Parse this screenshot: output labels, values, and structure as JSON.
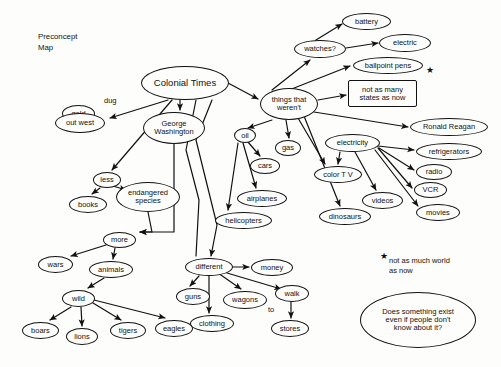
{
  "document": {
    "title_block": "Preconcept\nMap",
    "background_color": "#fdfdfc",
    "ink_color": "#111111",
    "width": 501,
    "height": 367
  },
  "nodes": [
    {
      "id": "colonial-times",
      "label": "Colonial Times",
      "shape": "ellipse",
      "x": 141,
      "y": 66,
      "w": 88,
      "h": 34,
      "font": 9.5
    },
    {
      "id": "gold",
      "label": "gold",
      "shape": "ellipse",
      "x": 62,
      "y": 105,
      "w": 33,
      "h": 17,
      "font": 7.5
    },
    {
      "id": "out-west",
      "label": "out west",
      "shape": "ellipse",
      "x": 55,
      "y": 113,
      "w": 50,
      "h": 20,
      "font": 7.5
    },
    {
      "id": "george-washington",
      "label": "George\nWashington",
      "shape": "ellipse",
      "x": 143,
      "y": 112,
      "w": 62,
      "h": 32,
      "font": 7.5
    },
    {
      "id": "things-that-werent",
      "label": "things that\nweren't",
      "shape": "ellipse",
      "x": 260,
      "y": 88,
      "w": 58,
      "h": 32,
      "font": 7.5
    },
    {
      "id": "battery",
      "label": "battery",
      "shape": "ellipse",
      "x": 342,
      "y": 13,
      "w": 49,
      "h": 17,
      "font": 7.5
    },
    {
      "id": "watches",
      "label": "watches?",
      "shape": "ellipse",
      "x": 294,
      "y": 40,
      "w": 52,
      "h": 18,
      "font": 7.5
    },
    {
      "id": "electric",
      "label": "electric",
      "shape": "ellipse",
      "x": 379,
      "y": 34,
      "w": 52,
      "h": 18,
      "font": 7.5
    },
    {
      "id": "ballpoint-pens",
      "label": "ballpoint pens",
      "shape": "ellipse",
      "x": 353,
      "y": 57,
      "w": 70,
      "h": 17,
      "font": 7.5
    },
    {
      "id": "not-as-many-states",
      "label": "not as many\nstates as now",
      "shape": "rect",
      "x": 348,
      "y": 80,
      "w": 69,
      "h": 27,
      "font": 7.5
    },
    {
      "id": "ronald-reagan",
      "label": "Ronald Reagan",
      "shape": "ellipse",
      "x": 410,
      "y": 118,
      "w": 78,
      "h": 18,
      "font": 7.5
    },
    {
      "id": "oil",
      "label": "oil",
      "shape": "ellipse",
      "x": 234,
      "y": 128,
      "w": 22,
      "h": 15,
      "font": 7.5
    },
    {
      "id": "gas",
      "label": "gas",
      "shape": "ellipse",
      "x": 275,
      "y": 140,
      "w": 26,
      "h": 16,
      "font": 7.5
    },
    {
      "id": "cars",
      "label": "cars",
      "shape": "ellipse",
      "x": 250,
      "y": 158,
      "w": 30,
      "h": 16,
      "font": 7.5
    },
    {
      "id": "airplanes",
      "label": "airplanes",
      "shape": "ellipse",
      "x": 237,
      "y": 190,
      "w": 50,
      "h": 17,
      "font": 7.5
    },
    {
      "id": "helicopters",
      "label": "helicopters",
      "shape": "ellipse",
      "x": 215,
      "y": 212,
      "w": 57,
      "h": 17,
      "font": 7.5
    },
    {
      "id": "electricity",
      "label": "electricity",
      "shape": "ellipse",
      "x": 325,
      "y": 134,
      "w": 55,
      "h": 18,
      "font": 7.5
    },
    {
      "id": "refrigerators",
      "label": "refrigerators",
      "shape": "ellipse",
      "x": 416,
      "y": 143,
      "w": 66,
      "h": 17,
      "font": 7.5
    },
    {
      "id": "radio",
      "label": "radio",
      "shape": "ellipse",
      "x": 416,
      "y": 164,
      "w": 36,
      "h": 16,
      "font": 7.5
    },
    {
      "id": "vcr",
      "label": "VCR",
      "shape": "ellipse",
      "x": 414,
      "y": 182,
      "w": 33,
      "h": 16,
      "font": 7.5
    },
    {
      "id": "movies",
      "label": "movies",
      "shape": "ellipse",
      "x": 416,
      "y": 204,
      "w": 44,
      "h": 17,
      "font": 7.5
    },
    {
      "id": "color-tv",
      "label": "color T V",
      "shape": "ellipse",
      "x": 314,
      "y": 166,
      "w": 48,
      "h": 17,
      "font": 7.5
    },
    {
      "id": "videos",
      "label": "videos",
      "shape": "ellipse",
      "x": 362,
      "y": 192,
      "w": 41,
      "h": 17,
      "font": 7.5
    },
    {
      "id": "dinosaurs",
      "label": "dinosaurs",
      "shape": "ellipse",
      "x": 319,
      "y": 208,
      "w": 52,
      "h": 17,
      "font": 7.5
    },
    {
      "id": "less",
      "label": "less",
      "shape": "ellipse",
      "x": 93,
      "y": 172,
      "w": 28,
      "h": 16,
      "font": 7.5
    },
    {
      "id": "books",
      "label": "books",
      "shape": "ellipse",
      "x": 69,
      "y": 196,
      "w": 38,
      "h": 17,
      "font": 7.5
    },
    {
      "id": "endangered-species",
      "label": "endangered\nspecies",
      "shape": "ellipse",
      "x": 116,
      "y": 182,
      "w": 64,
      "h": 30,
      "font": 7.5
    },
    {
      "id": "more",
      "label": "more",
      "shape": "ellipse",
      "x": 103,
      "y": 232,
      "w": 33,
      "h": 16,
      "font": 7.5
    },
    {
      "id": "wars",
      "label": "wars",
      "shape": "ellipse",
      "x": 38,
      "y": 256,
      "w": 35,
      "h": 17,
      "font": 7.5
    },
    {
      "id": "animals",
      "label": "animals",
      "shape": "ellipse",
      "x": 89,
      "y": 261,
      "w": 44,
      "h": 17,
      "font": 7.5
    },
    {
      "id": "wild",
      "label": "wild",
      "shape": "ellipse",
      "x": 62,
      "y": 290,
      "w": 33,
      "h": 17,
      "font": 7.5
    },
    {
      "id": "boars",
      "label": "boars",
      "shape": "ellipse",
      "x": 22,
      "y": 322,
      "w": 37,
      "h": 17,
      "font": 7.5
    },
    {
      "id": "lions",
      "label": "lions",
      "shape": "ellipse",
      "x": 66,
      "y": 328,
      "w": 32,
      "h": 17,
      "font": 7.5
    },
    {
      "id": "tigers",
      "label": "tigers",
      "shape": "ellipse",
      "x": 110,
      "y": 322,
      "w": 36,
      "h": 17,
      "font": 7.5
    },
    {
      "id": "eagles",
      "label": "eagles",
      "shape": "ellipse",
      "x": 155,
      "y": 320,
      "w": 38,
      "h": 17,
      "font": 7.5
    },
    {
      "id": "different",
      "label": "different",
      "shape": "ellipse",
      "x": 185,
      "y": 258,
      "w": 48,
      "h": 18,
      "font": 7.5
    },
    {
      "id": "money",
      "label": "money",
      "shape": "ellipse",
      "x": 251,
      "y": 259,
      "w": 42,
      "h": 17,
      "font": 7.5
    },
    {
      "id": "guns",
      "label": "guns",
      "shape": "ellipse",
      "x": 176,
      "y": 288,
      "w": 34,
      "h": 17,
      "font": 7.5
    },
    {
      "id": "wagons",
      "label": "wagons",
      "shape": "ellipse",
      "x": 223,
      "y": 291,
      "w": 44,
      "h": 18,
      "font": 7.5
    },
    {
      "id": "walk",
      "label": "walk",
      "shape": "ellipse",
      "x": 275,
      "y": 285,
      "w": 34,
      "h": 17,
      "font": 7.5
    },
    {
      "id": "clothing",
      "label": "clothing",
      "shape": "ellipse",
      "x": 190,
      "y": 315,
      "w": 44,
      "h": 17,
      "font": 7.5
    },
    {
      "id": "stores",
      "label": "stores",
      "shape": "ellipse",
      "x": 271,
      "y": 320,
      "w": 38,
      "h": 17,
      "font": 7.5
    },
    {
      "id": "does-something-exist",
      "label": "Does something exist\neven if people don't\nknow about it?",
      "shape": "ellipse",
      "x": 360,
      "y": 292,
      "w": 116,
      "h": 56,
      "font": 7.5
    }
  ],
  "edge_labels": [
    {
      "id": "dug-label",
      "text": "dug",
      "x": 104,
      "y": 96,
      "font": 7.5
    },
    {
      "id": "to-label",
      "text": "to",
      "x": 268,
      "y": 305,
      "font": 7.5
    }
  ],
  "free_texts": [
    {
      "id": "footnote",
      "text": "not as much world\nas now",
      "x": 389,
      "y": 256,
      "font": 7.5
    }
  ],
  "stars": [
    {
      "id": "star-top",
      "x": 426,
      "y": 66,
      "font": 9
    },
    {
      "id": "star-footnote",
      "x": 380,
      "y": 252,
      "font": 9
    }
  ],
  "edges": [
    {
      "from": "colonial-times",
      "to": "out-west",
      "path": "M 168 100 L 110 118",
      "arrow": true
    },
    {
      "from": "colonial-times",
      "to": "george-washington",
      "path": "M 180 100 L 180 110",
      "arrow": true
    },
    {
      "from": "colonial-times",
      "to": "less",
      "path": "M 172 100 L 112 170",
      "arrow": true
    },
    {
      "from": "colonial-times",
      "to": "things-that-werent",
      "path": "M 228 83 L 258 99",
      "arrow": true
    },
    {
      "from": "colonial-times",
      "to": "different",
      "path": "M 212 100 L 196 140 L 217 225 L 211 256",
      "arrow": true
    },
    {
      "from": "colonial-times",
      "to": "oil-branch",
      "path": "M 196 100 L 186 150 L 199 200 L 196 256",
      "arrow": false
    },
    {
      "from": "george-washington",
      "to": "more",
      "path": "M 174 144 L 174 232 L 140 232",
      "arrow": true
    },
    {
      "from": "less",
      "to": "books",
      "path": "M 100 188 L 92 194",
      "arrow": true
    },
    {
      "from": "less",
      "to": "endangered-species",
      "path": "M 113 186 L 126 190",
      "arrow": true
    },
    {
      "from": "endangered-species",
      "to": "more",
      "path": "M 148 212 L 152 232 L 140 232",
      "arrow": true
    },
    {
      "from": "more",
      "to": "wars",
      "path": "M 106 245 L 71 256",
      "arrow": true
    },
    {
      "from": "more",
      "to": "animals",
      "path": "M 115 248 L 113 259",
      "arrow": true
    },
    {
      "from": "animals",
      "to": "wild",
      "path": "M 104 278 L 88 288",
      "arrow": true
    },
    {
      "from": "wild",
      "to": "boars",
      "path": "M 71 307 L 50 320",
      "arrow": true
    },
    {
      "from": "wild",
      "to": "lions",
      "path": "M 81 307 L 82 326",
      "arrow": true
    },
    {
      "from": "wild",
      "to": "tigers",
      "path": "M 93 303 L 121 320",
      "arrow": true
    },
    {
      "from": "wild",
      "to": "eagles",
      "path": "M 94 300 L 165 318",
      "arrow": true
    },
    {
      "from": "different",
      "to": "guns",
      "path": "M 199 276 L 190 286",
      "arrow": true
    },
    {
      "from": "different",
      "to": "clothing",
      "path": "M 209 276 L 209 313",
      "arrow": true
    },
    {
      "from": "different",
      "to": "wagons",
      "path": "M 218 273 L 241 289",
      "arrow": true
    },
    {
      "from": "different",
      "to": "money",
      "path": "M 233 267 L 249 267",
      "arrow": true
    },
    {
      "from": "different",
      "to": "walk",
      "path": "M 227 273 L 281 289",
      "arrow": true
    },
    {
      "from": "walk",
      "to": "stores",
      "path": "M 291 302 L 291 318",
      "arrow": true
    },
    {
      "from": "things-that-werent",
      "to": "watches",
      "path": "M 272 90 L 310 60",
      "arrow": true
    },
    {
      "from": "watches",
      "to": "battery",
      "path": "M 316 40 L 342 24",
      "arrow": true
    },
    {
      "from": "watches",
      "to": "electric",
      "path": "M 346 48 L 378 43",
      "arrow": true
    },
    {
      "from": "things-that-werent",
      "to": "ballpoint-pens",
      "path": "M 284 92 L 350 66",
      "arrow": true
    },
    {
      "from": "things-that-werent",
      "to": "not-as-many-states",
      "path": "M 318 100 L 346 95",
      "arrow": true
    },
    {
      "from": "things-that-werent",
      "to": "ronald-reagan",
      "path": "M 314 112 L 408 127",
      "arrow": true
    },
    {
      "from": "things-that-werent",
      "to": "oil",
      "path": "M 272 120 L 248 128",
      "arrow": true
    },
    {
      "from": "things-that-werent",
      "to": "gas",
      "path": "M 286 120 L 289 138",
      "arrow": true
    },
    {
      "from": "things-that-werent",
      "to": "color-tv",
      "path": "M 298 118 L 325 164",
      "arrow": true
    },
    {
      "from": "things-that-werent",
      "to": "dinosaurs",
      "path": "M 304 116 L 340 206",
      "arrow": true
    },
    {
      "from": "oil",
      "to": "cars",
      "path": "M 248 142 L 260 156",
      "arrow": true
    },
    {
      "from": "oil",
      "to": "airplanes",
      "path": "M 243 143 L 256 188",
      "arrow": true
    },
    {
      "from": "oil",
      "to": "helicopters",
      "path": "M 238 143 L 228 210",
      "arrow": true
    },
    {
      "from": "electricity",
      "to": "refrigerators",
      "path": "M 378 146 L 414 150",
      "arrow": true
    },
    {
      "from": "electricity",
      "to": "radio",
      "path": "M 379 148 L 414 170",
      "arrow": true
    },
    {
      "from": "electricity",
      "to": "vcr",
      "path": "M 378 148 L 412 188",
      "arrow": true
    },
    {
      "from": "electricity",
      "to": "movies",
      "path": "M 375 150 L 418 206",
      "arrow": true
    },
    {
      "from": "electricity",
      "to": "videos",
      "path": "M 355 152 L 376 190",
      "arrow": true
    },
    {
      "from": "electricity",
      "to": "color-tv",
      "path": "M 340 152 L 338 164",
      "arrow": true
    }
  ]
}
